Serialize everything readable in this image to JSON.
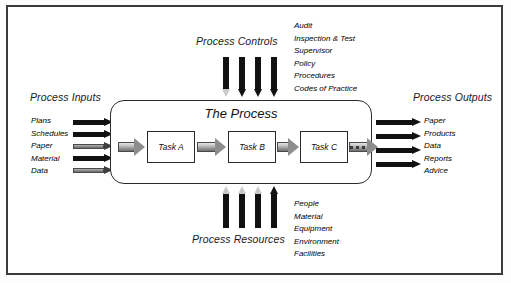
{
  "diagram": {
    "title": "The Process",
    "tasks": [
      {
        "label": "Task A"
      },
      {
        "label": "Task B"
      },
      {
        "label": "Task C"
      }
    ],
    "inputs": {
      "heading": "Process Inputs",
      "items": [
        "Plans",
        "Schedules",
        "Paper",
        "Material",
        "Data"
      ]
    },
    "outputs": {
      "heading": "Process Outputs",
      "items": [
        "Paper",
        "Products",
        "Data",
        "Reports",
        "Advice"
      ]
    },
    "controls": {
      "heading": "Process Controls",
      "items": [
        "Audit",
        "Inspection & Test",
        "Supervisor",
        "Policy",
        "Procedures",
        "Codes of Practice"
      ]
    },
    "resources": {
      "heading": "Process Resources",
      "items": [
        "People",
        "Material",
        "Equipment",
        "Environment",
        "Facilities"
      ]
    }
  }
}
